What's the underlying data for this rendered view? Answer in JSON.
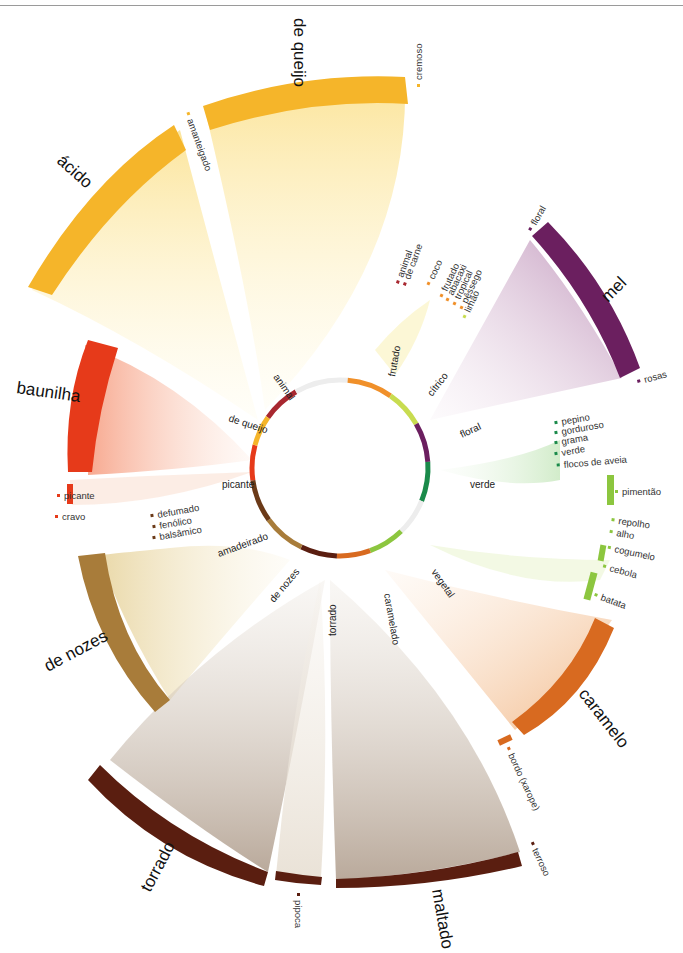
{
  "chart_data": {
    "type": "chord",
    "title": "",
    "center": [
      340,
      468
    ],
    "inner_ring": {
      "radius": 88,
      "segments": [
        {
          "label": "animal",
          "start": 305,
          "end": 330,
          "color": "#a82830"
        },
        {
          "label": "",
          "start": 330,
          "end": 5,
          "color": "#ededed"
        },
        {
          "label": "frutado",
          "start": 5,
          "end": 35,
          "color": "#f0902a"
        },
        {
          "label": "cítrico",
          "start": 35,
          "end": 60,
          "color": "#c8dc50"
        },
        {
          "label": "floral",
          "start": 60,
          "end": 86,
          "color": "#6b1f5f"
        },
        {
          "label": "verde",
          "start": 86,
          "end": 112,
          "color": "#1a8a4a"
        },
        {
          "label": "",
          "start": 112,
          "end": 136,
          "color": "#ededed"
        },
        {
          "label": "vegetal",
          "start": 136,
          "end": 160,
          "color": "#8cc63f"
        },
        {
          "label": "caramelado",
          "start": 160,
          "end": 182,
          "color": "#d86a20"
        },
        {
          "label": "torrado",
          "start": 182,
          "end": 206,
          "color": "#5a1e10"
        },
        {
          "label": "de nozes",
          "start": 206,
          "end": 234,
          "color": "#a87c3a"
        },
        {
          "label": "amadeirado",
          "start": 234,
          "end": 262,
          "color": "#6b3a18"
        },
        {
          "label": "picante",
          "start": 262,
          "end": 285,
          "color": "#e63a1a"
        },
        {
          "label": "de queijo",
          "start": 285,
          "end": 305,
          "color": "#f5b52a"
        }
      ]
    },
    "outer_arcs": [
      {
        "label": "de queijo",
        "start": 350,
        "end": 28,
        "r_in": 330,
        "r_out": 350,
        "color": "#f5b52a",
        "ribbon": "#fbe38a",
        "target": 295
      },
      {
        "label": "ácido",
        "start": 300,
        "end": 333,
        "r_in": 330,
        "r_out": 350,
        "color": "#f5b52a",
        "ribbon": "#fbe38a",
        "target": 292
      },
      {
        "label": "baunilha",
        "start": 268,
        "end": 292,
        "r_in": 255,
        "r_out": 275,
        "color": "#e63a1a",
        "ribbon": "#f7a07a",
        "target": 273
      },
      {
        "label": "de nozes",
        "start": 220,
        "end": 245,
        "r_in": 255,
        "r_out": 275,
        "color": "#a87c3a",
        "ribbon": "#e6d6a0",
        "target": 220
      },
      {
        "label": "torrado",
        "start": 205,
        "end": 238,
        "r_in": 405,
        "r_out": 423,
        "color": "#5a1e10",
        "ribbon": "#b5a394",
        "target": 194
      },
      {
        "label": "pipoca",
        "start": 182,
        "end": 189,
        "r_in": 410,
        "r_out": 418,
        "color": "#5a1e10",
        "ribbon": "#e8e0d4",
        "target": 194
      },
      {
        "label": "maltado",
        "start": 155,
        "end": 180,
        "r_in": 405,
        "r_out": 423,
        "color": "#5a1e10",
        "ribbon": "#b5a394",
        "target": 194
      },
      {
        "label": "caramelo",
        "start": 118,
        "end": 145,
        "r_in": 255,
        "r_out": 275,
        "color": "#d86a20",
        "ribbon": "#f5c08e",
        "target": 171
      },
      {
        "label": "mel",
        "start": 42,
        "end": 70,
        "r_in": 255,
        "r_out": 275,
        "color": "#6b1f5f",
        "ribbon": "#c9a0c4",
        "target": 73
      }
    ],
    "small_labels": [
      {
        "text": "amanteigado",
        "x": 187,
        "y": 120,
        "rot": 70,
        "mark": "#f5b52a"
      },
      {
        "text": "cremoso",
        "x": 422,
        "y": 80,
        "rot": -90,
        "mark": "#f5b52a"
      },
      {
        "text": "animal",
        "x": 403,
        "y": 278,
        "rot": -70,
        "mark": "#a82830"
      },
      {
        "text": "de carne",
        "x": 410,
        "y": 280,
        "rot": -70,
        "mark": "#a82830"
      },
      {
        "text": "coco",
        "x": 434,
        "y": 280,
        "rot": -65,
        "mark": "#f0902a"
      },
      {
        "text": "frutado",
        "x": 447,
        "y": 292,
        "rot": -65,
        "mark": "#f0902a"
      },
      {
        "text": "abacaxi",
        "x": 453,
        "y": 296,
        "rot": -65,
        "mark": "#f0902a"
      },
      {
        "text": "tropical",
        "x": 460,
        "y": 300,
        "rot": -65,
        "mark": "#f0902a"
      },
      {
        "text": "pêssego",
        "x": 467,
        "y": 304,
        "rot": -65,
        "mark": "#f0902a"
      },
      {
        "text": "limão",
        "x": 470,
        "y": 313,
        "rot": -65,
        "mark": "#c8dc50"
      },
      {
        "text": "floral",
        "x": 536,
        "y": 226,
        "rot": -60,
        "mark": "#6b1f5f"
      },
      {
        "text": "rosas",
        "x": 645,
        "y": 383,
        "rot": -15,
        "mark": "#6b1f5f"
      },
      {
        "text": "pepino",
        "x": 562,
        "y": 425,
        "rot": -10,
        "mark": "#1a8a4a"
      },
      {
        "text": "gorduroso",
        "x": 562,
        "y": 435,
        "rot": -10,
        "mark": "#1a8a4a"
      },
      {
        "text": "grama",
        "x": 562,
        "y": 445,
        "rot": -10,
        "mark": "#1a8a4a"
      },
      {
        "text": "verde",
        "x": 562,
        "y": 456,
        "rot": -10,
        "mark": "#1a8a4a"
      },
      {
        "text": "flocos de aveia",
        "x": 564,
        "y": 468,
        "rot": -5,
        "mark": "#1a8a4a"
      },
      {
        "text": "pimentão",
        "x": 622,
        "y": 495,
        "rot": 0,
        "mark": "#8cc63f"
      },
      {
        "text": "repolho",
        "x": 618,
        "y": 524,
        "rot": 8,
        "mark": "#8cc63f"
      },
      {
        "text": "alho",
        "x": 616,
        "y": 536,
        "rot": 10,
        "mark": "#8cc63f"
      },
      {
        "text": "cogumelo",
        "x": 614,
        "y": 552,
        "rot": 12,
        "mark": "#8cc63f"
      },
      {
        "text": "cebola",
        "x": 609,
        "y": 571,
        "rot": 15,
        "mark": "#8cc63f"
      },
      {
        "text": "batata",
        "x": 600,
        "y": 600,
        "rot": 20,
        "mark": "#8cc63f"
      },
      {
        "text": "bordo (xarope)",
        "x": 508,
        "y": 755,
        "rot": 65,
        "mark": "#d86a20"
      },
      {
        "text": "terroso",
        "x": 532,
        "y": 850,
        "rot": 65,
        "mark": "#5a1e10"
      },
      {
        "text": "pipoca",
        "x": 295,
        "y": 900,
        "rot": 90,
        "mark": "#5a1e10"
      },
      {
        "text": "picante",
        "x": 64,
        "y": 499,
        "rot": 0,
        "mark": "#e63a1a"
      },
      {
        "text": "cravo",
        "x": 62,
        "y": 520,
        "rot": 0,
        "mark": "#e63a1a"
      },
      {
        "text": "defumado",
        "x": 158,
        "y": 518,
        "rot": -10,
        "mark": "#6b3a18"
      },
      {
        "text": "fenólico",
        "x": 160,
        "y": 529,
        "rot": -10,
        "mark": "#6b3a18"
      },
      {
        "text": "balsâmico",
        "x": 160,
        "y": 540,
        "rot": -10,
        "mark": "#6b3a18"
      }
    ]
  },
  "labels": {
    "ring": {
      "animal": "animal",
      "frutado": "frutado",
      "citrico": "cítrico",
      "floral": "floral",
      "verde": "verde",
      "vegetal": "vegetal",
      "caramelado": "caramelado",
      "torrado": "torrado",
      "de_nozes": "de nozes",
      "amadeirado": "amadeirado",
      "picante": "picante",
      "de_queijo": "de queijo"
    },
    "big": {
      "de_queijo": "de queijo",
      "acido": "ácido",
      "baunilha": "baunilha",
      "de_nozes": "de nozes",
      "torrado": "torrado",
      "maltado": "maltado",
      "caramelo": "caramelo",
      "mel": "mel"
    },
    "small": {
      "amanteigado": "amanteigado",
      "cremoso": "cremoso",
      "animal": "animal",
      "de_carne": "de carne",
      "coco": "coco",
      "frutado": "frutado",
      "abacaxi": "abacaxi",
      "tropical": "tropical",
      "pessego": "pêssego",
      "limao": "limão",
      "floral": "floral",
      "rosas": "rosas",
      "pepino": "pepino",
      "gorduroso": "gorduroso",
      "grama": "grama",
      "verde": "verde",
      "flocos": "flocos de aveia",
      "pimentao": "pimentão",
      "repolho": "repolho",
      "alho": "alho",
      "cogumelo": "cogumelo",
      "cebola": "cebola",
      "batata": "batata",
      "bordo": "bordo (xarope)",
      "terroso": "terroso",
      "pipoca": "pipoca",
      "picante": "picante",
      "cravo": "cravo",
      "defumado": "defumado",
      "fenolico": "fenólico",
      "balsamico": "balsâmico"
    }
  }
}
